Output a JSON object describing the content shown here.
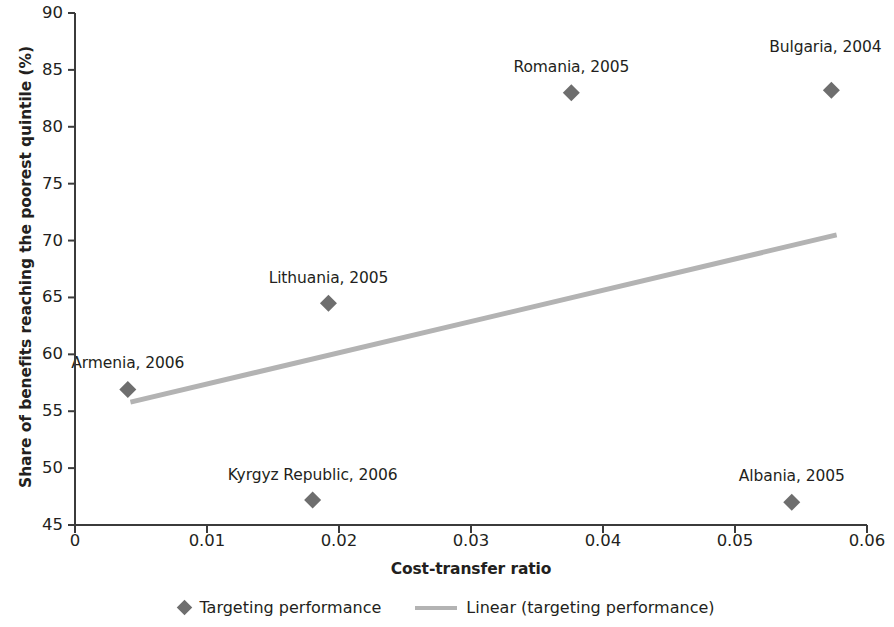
{
  "chart_data": {
    "type": "scatter",
    "title": "",
    "xlabel": "Cost-transfer ratio",
    "ylabel": "Share of benefits reaching the poorest quintile (%)",
    "xlim": [
      0,
      0.06
    ],
    "ylim": [
      45,
      90
    ],
    "xticks": [
      "0",
      "0.01",
      "0.02",
      "0.03",
      "0.04",
      "0.05",
      "0.06"
    ],
    "xtick_values": [
      0,
      0.01,
      0.02,
      0.03,
      0.04,
      0.05,
      0.06
    ],
    "yticks": [
      "45",
      "50",
      "55",
      "60",
      "65",
      "70",
      "75",
      "80",
      "85",
      "90"
    ],
    "ytick_values": [
      45,
      50,
      55,
      60,
      65,
      70,
      75,
      80,
      85,
      90
    ],
    "grid": false,
    "legend_position": "bottom",
    "marker_color": "#6e6e6e",
    "trendline_color": "#b3b3b3",
    "axis_color": "#3b3b3b",
    "points": [
      {
        "label": "Armenia, 2006",
        "x": 0.004,
        "y": 56.9,
        "label_dx": 0,
        "label_dy": -34
      },
      {
        "label": "Kyrgyz Republic, 2006",
        "x": 0.018,
        "y": 47.2,
        "label_dx": 0,
        "label_dy": -32
      },
      {
        "label": "Lithuania, 2005",
        "x": 0.0192,
        "y": 64.5,
        "label_dx": 0,
        "label_dy": -32
      },
      {
        "label": "Romania, 2005",
        "x": 0.0376,
        "y": 83.0,
        "label_dx": 0,
        "label_dy": -33
      },
      {
        "label": "Albania, 2005",
        "x": 0.0543,
        "y": 47.0,
        "label_dx": 0,
        "label_dy": -33
      },
      {
        "label": "Bulgaria, 2004",
        "x": 0.0573,
        "y": 83.2,
        "label_dx": -6,
        "label_dy": -50
      }
    ],
    "trendline": {
      "name": "Linear (targeting performance)",
      "x_start": 0.0042,
      "y_start": 55.8,
      "x_end": 0.0577,
      "y_end": 70.5
    },
    "legend": [
      {
        "name": "series-marker",
        "marker": "diamond-icon",
        "label": "Targeting performance"
      },
      {
        "name": "series-trendline",
        "marker": "line-icon",
        "label": "Linear (targeting performance)"
      }
    ]
  }
}
